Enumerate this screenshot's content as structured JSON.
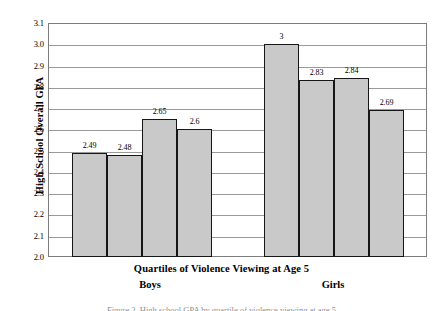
{
  "chart_data": {
    "type": "bar",
    "title": "",
    "xlabel": "Quartiles of Violence Viewing at Age 5",
    "ylabel": "High School Overall GPA",
    "ylim": [
      2.0,
      3.1
    ],
    "ytick_step": 0.1,
    "yticks": [
      "3.1",
      "3.0",
      "2.9",
      "2.8",
      "2.7",
      "2.6",
      "2.5",
      "2.4",
      "2.3",
      "2.2",
      "2.1",
      "2.0"
    ],
    "grid": true,
    "legend": "none",
    "groups": [
      {
        "name": "Boys",
        "label": "Boys",
        "categories": [
          "Q1",
          "Q2",
          "Q3",
          "Q4"
        ],
        "values": [
          2.49,
          2.48,
          2.65,
          2.6
        ],
        "value_labels": [
          "2.49",
          "2.48",
          "2.65",
          "2.6"
        ]
      },
      {
        "name": "Girls",
        "label": "Girls",
        "categories": [
          "Q1",
          "Q2",
          "Q3",
          "Q4"
        ],
        "values": [
          3.0,
          2.83,
          2.84,
          2.69
        ],
        "value_labels": [
          "3",
          "2.83",
          "2.84",
          "2.69"
        ]
      }
    ],
    "colors": {
      "bar_fill": "#c9c9c9",
      "bar_border": "#161616",
      "gridline": "#9a9a9a",
      "frame": "#7d7d7d",
      "text": "#000000"
    }
  },
  "caption": {
    "text": "Figure 2.   High school GPA by quartile of violence viewing at age 5"
  }
}
